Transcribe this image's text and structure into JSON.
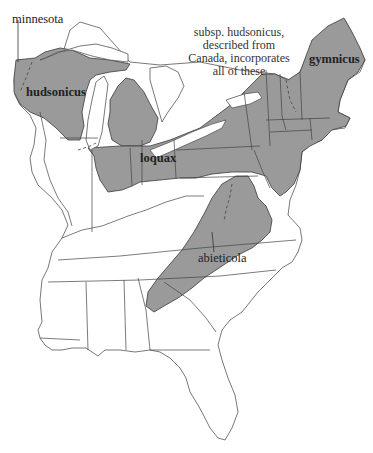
{
  "map": {
    "subject": "Range of subspecies in eastern United States",
    "colors": {
      "range_fill": "#9a9a9a",
      "land_fill": "#ffffff",
      "outline": "#444444"
    },
    "labels": {
      "minnesota": "minnesota",
      "hudsonicus": "hudsonicus",
      "loquax": "loquax",
      "gymnicus": "gymnicus",
      "abieticola": "abieticola"
    },
    "note": {
      "line1": "subsp. hudsonicus,",
      "line2": "described from",
      "line3": "Canada, incorporates",
      "line4": "all of these"
    },
    "legend_regions": [
      {
        "name": "minnesota",
        "shaded": true
      },
      {
        "name": "hudsonicus",
        "shaded": true
      },
      {
        "name": "loquax",
        "shaded": true
      },
      {
        "name": "gymnicus",
        "shaded": true
      },
      {
        "name": "abieticola",
        "shaded": true
      }
    ]
  }
}
